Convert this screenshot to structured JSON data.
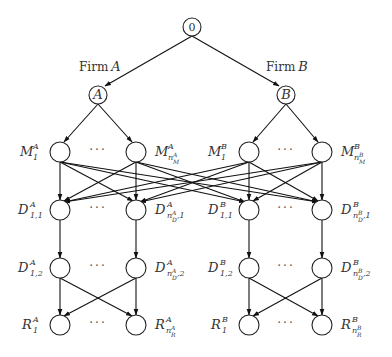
{
  "diagram": {
    "root": {
      "label": "0"
    },
    "firms": [
      {
        "edge_label_prefix": "Firm",
        "edge_label_var": "A",
        "node_label": "A"
      },
      {
        "edge_label_prefix": "Firm",
        "edge_label_var": "B",
        "node_label": "B"
      }
    ],
    "ellipsis": "···",
    "levels": {
      "M": {
        "A": {
          "first": {
            "base": "M",
            "sup": "A",
            "sub": "1"
          },
          "last": {
            "base": "M",
            "sup": "A",
            "sub": "n",
            "subsup": "A",
            "subsub": "M"
          }
        },
        "B": {
          "first": {
            "base": "M",
            "sup": "B",
            "sub": "1"
          },
          "last": {
            "base": "M",
            "sup": "B",
            "sub": "n",
            "subsup": "B",
            "subsub": "M"
          }
        }
      },
      "D1": {
        "A": {
          "first": {
            "base": "D",
            "sup": "A",
            "sub": "1,1"
          },
          "last": {
            "base": "D",
            "sup": "A",
            "sub": "n",
            "subsup": "A",
            "subsub": "D",
            "tail": ",1"
          }
        },
        "B": {
          "first": {
            "base": "D",
            "sup": "B",
            "sub": "1,1"
          },
          "last": {
            "base": "D",
            "sup": "B",
            "sub": "n",
            "subsup": "B",
            "subsub": "D",
            "tail": ",1"
          }
        }
      },
      "D2": {
        "A": {
          "first": {
            "base": "D",
            "sup": "A",
            "sub": "1,2"
          },
          "last": {
            "base": "D",
            "sup": "A",
            "sub": "n",
            "subsup": "A",
            "subsub": "D",
            "tail": ",2"
          }
        },
        "B": {
          "first": {
            "base": "D",
            "sup": "B",
            "sub": "1,2"
          },
          "last": {
            "base": "D",
            "sup": "B",
            "sub": "n",
            "subsup": "B",
            "subsub": "D",
            "tail": ",2"
          }
        }
      },
      "R": {
        "A": {
          "first": {
            "base": "R",
            "sup": "A",
            "sub": "1"
          },
          "last": {
            "base": "R",
            "sup": "A",
            "sub": "n",
            "subsup": "A",
            "subsub": "R"
          }
        },
        "B": {
          "first": {
            "base": "R",
            "sup": "B",
            "sub": "1"
          },
          "last": {
            "base": "R",
            "sup": "B",
            "sub": "n",
            "subsup": "B",
            "subsub": "R"
          }
        }
      }
    }
  }
}
